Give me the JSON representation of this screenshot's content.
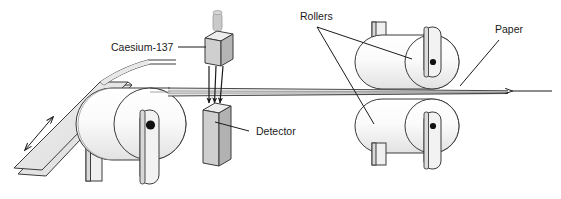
{
  "diagram": {
    "background_color": "#ffffff",
    "stroke_color": "#3b3b3b",
    "fill_light": "#f2f2f2",
    "fill_mid": "#dcdcdc",
    "fill_dark": "#b8b8b8",
    "labels": {
      "source": "Caesium-137",
      "detector": "Detector",
      "rollers": "Rollers",
      "paper": "Paper"
    },
    "components": {
      "source_box": {
        "name": "Caesium-137",
        "description": "shielded gamma source housing with cylindrical cap",
        "x": 205,
        "y": 30,
        "width": 26,
        "height": 34
      },
      "detector_box": {
        "name": "Detector",
        "description": "tall rectangular detector block beneath the paper web",
        "x": 203,
        "y": 104,
        "width": 26,
        "height": 60
      },
      "beam_arrows": {
        "count": 3,
        "direction": "downward",
        "from": "Caesium-137",
        "to": "Detector",
        "description": "gamma rays passing through the paper"
      },
      "paper_roll": {
        "description": "large supply roll on the left with central axle",
        "cx": 148,
        "cy": 124,
        "r": 36
      },
      "paper_stack": {
        "description": "sloping sheet of paper feeding off the roll with a double-headed motion arrow"
      },
      "roller_upper": {
        "label": "Rollers",
        "cx": 432,
        "cy": 62,
        "r": 27
      },
      "roller_lower": {
        "label": "Rollers",
        "cx": 432,
        "cy": 126,
        "r": 27
      },
      "paper_web": {
        "label": "Paper",
        "description": "thin horizontal paper web running right to left between rollers",
        "y": 92
      },
      "direction_arrow": {
        "description": "arrow showing paper travel direction, pointing left",
        "x": 510,
        "y": 91,
        "points": "left"
      }
    }
  }
}
